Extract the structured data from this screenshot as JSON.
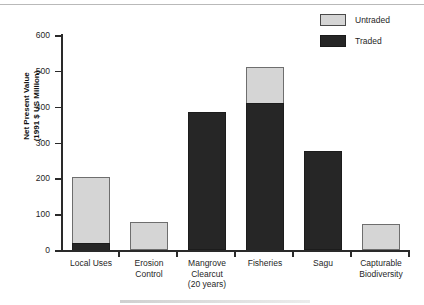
{
  "chart_data": {
    "type": "bar",
    "subtype": "stacked-vertical",
    "title": "",
    "xlabel": "",
    "ylabel": "Net Present Value\n(1991 $ US Million)",
    "ylim": [
      0,
      600
    ],
    "yticks": [
      0,
      100,
      200,
      300,
      400,
      500,
      600
    ],
    "grid": false,
    "legend_position": "top-right",
    "categories": [
      "Local Uses",
      "Erosion\nControl",
      "Mangrove\nClearcut\n(20 years)",
      "Fisheries",
      "Sagu",
      "Capturable\nBiodiversity"
    ],
    "series": [
      {
        "name": "Traded",
        "color": "#262626",
        "values": [
          20,
          0,
          385,
          410,
          277,
          0
        ]
      },
      {
        "name": "Untraded",
        "color": "#d5d5d5",
        "values": [
          185,
          78,
          0,
          102,
          0,
          72
        ]
      }
    ],
    "totals": [
      205,
      78,
      385,
      512,
      277,
      72
    ]
  },
  "axis": {
    "y_title_line1": "Net Present Value",
    "y_title_line2": "(1991 $ US Million)",
    "y_title": "Net Present Value\n(1991 $ US Million)",
    "tick_labels": [
      "0",
      "100",
      "200",
      "300",
      "400",
      "500",
      "600"
    ]
  },
  "legend": {
    "items": [
      {
        "label": "Untraded",
        "color": "#d5d5d5",
        "swatch": "untraded-swatch"
      },
      {
        "label": "Traded",
        "color": "#262626",
        "swatch": "traded-swatch"
      }
    ]
  },
  "colors": {
    "untraded": "#d5d5d5",
    "traded": "#262626",
    "axis": "#2a2a2a",
    "background": "#ffffff",
    "text": "#1f1f1f"
  }
}
